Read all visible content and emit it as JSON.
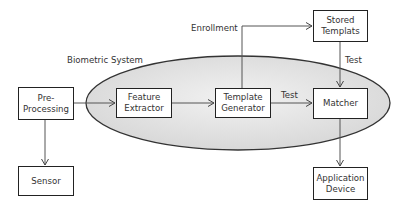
{
  "diagram": {
    "container": {
      "label": "Biometric System",
      "fill": "#e3e3e3"
    },
    "nodes": [
      {
        "id": "preprocessing",
        "label": "Pre-\nProcessing"
      },
      {
        "id": "feature_extractor",
        "label": "Feature\nExtractor"
      },
      {
        "id": "template_generator",
        "label": "Template\nGenerator"
      },
      {
        "id": "matcher",
        "label": "Matcher"
      },
      {
        "id": "stored_templates",
        "label": "Stored\nTemplats"
      },
      {
        "id": "sensor",
        "label": "Sensor"
      },
      {
        "id": "application_device",
        "label": "Application\nDevice"
      }
    ],
    "edges": [
      {
        "from": "preprocessing",
        "to": "feature_extractor",
        "label": ""
      },
      {
        "from": "feature_extractor",
        "to": "template_generator",
        "label": ""
      },
      {
        "from": "template_generator",
        "to": "matcher",
        "label": "Test"
      },
      {
        "from": "template_generator",
        "to": "stored_templates",
        "label": "Enrollment"
      },
      {
        "from": "stored_templates",
        "to": "matcher",
        "label": "Test"
      },
      {
        "from": "preprocessing",
        "to": "sensor",
        "label": ""
      },
      {
        "from": "matcher",
        "to": "application_device",
        "label": ""
      }
    ]
  }
}
